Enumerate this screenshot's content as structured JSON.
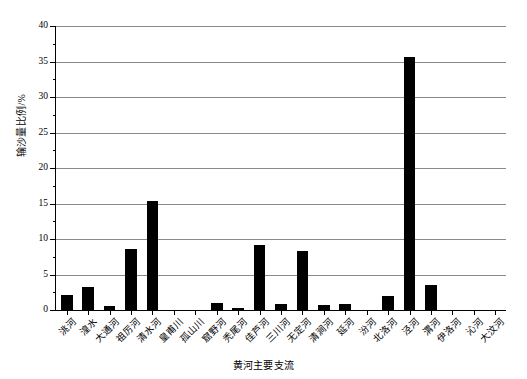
{
  "chart_data": {
    "type": "bar",
    "title": "",
    "xlabel": "黄河主要支流",
    "ylabel": "输沙量比例/%",
    "ylim": [
      0,
      40
    ],
    "ytick_step": 5,
    "yminor_step": 2.5,
    "grid": "horizontal",
    "legend": "none",
    "bar_color": "#000000",
    "grid_color": "#8a8a8a",
    "axis_color": "#000000",
    "categories": [
      "洮河",
      "湟水",
      "大通河",
      "祖厉河",
      "清水河",
      "皇甫川",
      "孤山川",
      "窟野河",
      "秃尾河",
      "佳芦河",
      "三川河",
      "无定河",
      "清涧河",
      "延河",
      "汾河",
      "北洛河",
      "泾河",
      "渭河",
      "伊洛河",
      "沁河",
      "大汶河"
    ],
    "values": [
      2.1,
      3.2,
      0.5,
      8.6,
      15.3,
      0.0,
      0.0,
      1.0,
      0.3,
      9.2,
      0.8,
      8.3,
      0.7,
      0.9,
      0.0,
      2.0,
      35.6,
      3.5,
      0.0,
      0.0,
      0.0
    ],
    "ytick_labels": [
      "0",
      "5",
      "10",
      "15",
      "20",
      "25",
      "30",
      "35",
      "40"
    ]
  }
}
